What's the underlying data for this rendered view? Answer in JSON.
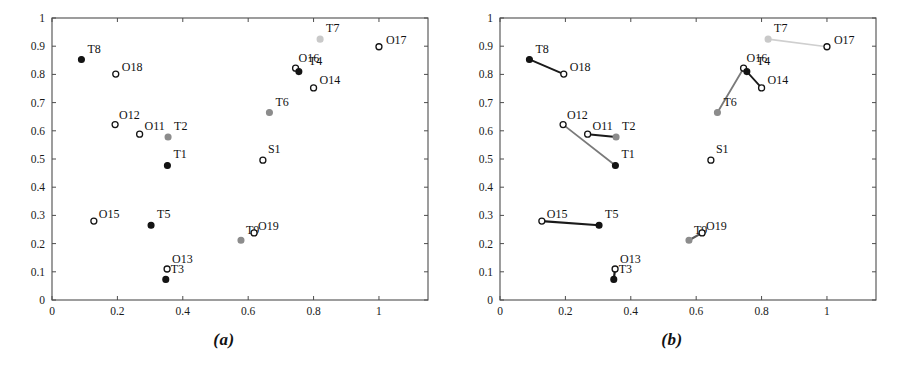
{
  "figure": {
    "width": 897,
    "height": 375,
    "background": "#ffffff"
  },
  "panels": [
    {
      "id": "a",
      "caption": "(a)",
      "shows_links": false
    },
    {
      "id": "b",
      "caption": "(b)",
      "shows_links": true
    }
  ],
  "colors": {
    "axis": "#4d4d4d",
    "text": "#111111",
    "marker_dark": "#141414",
    "marker_gray": "#8c8c8c",
    "marker_open": "#ffffff",
    "link_black": "#1a1a1a",
    "link_gray": "#7a7a7a",
    "link_light": "#cfcfcf"
  },
  "chart_data": {
    "type": "scatter",
    "title": "",
    "xlabel": "",
    "ylabel": "",
    "xlim": [
      0,
      1.15
    ],
    "ylim": [
      0,
      1.0
    ],
    "grid": false,
    "legend": "none",
    "xticks": [
      "0",
      "0.2",
      "0.4",
      "0.6",
      "0.8",
      "1"
    ],
    "xtick_values": [
      0,
      0.2,
      0.4,
      0.6,
      0.8,
      1
    ],
    "ytick_values": [
      0,
      0.1,
      0.2,
      0.3,
      0.4,
      0.5,
      0.6,
      0.7,
      0.8,
      0.9,
      1
    ],
    "yticks": [
      "0",
      "0.1",
      "0.2",
      "0.3",
      "0.4",
      "0.5",
      "0.6",
      "0.7",
      "0.8",
      "0.9",
      "1"
    ],
    "points": [
      {
        "label": "T8",
        "x": 0.09,
        "y": 0.853,
        "marker": "filled",
        "shade": "dark",
        "lx": 6,
        "ly": -6
      },
      {
        "label": "O18",
        "x": 0.195,
        "y": 0.801,
        "marker": "open",
        "shade": "dark",
        "lx": 6,
        "ly": -3
      },
      {
        "label": "T7",
        "x": 0.82,
        "y": 0.925,
        "marker": "filled",
        "shade": "light",
        "lx": 6,
        "ly": -7
      },
      {
        "label": "O17",
        "x": 1.0,
        "y": 0.898,
        "marker": "open",
        "shade": "dark",
        "lx": 7,
        "ly": -3
      },
      {
        "label": "O16",
        "x": 0.745,
        "y": 0.822,
        "marker": "open",
        "shade": "dark",
        "lx": 3,
        "ly": -6
      },
      {
        "label": "T4",
        "x": 0.755,
        "y": 0.81,
        "marker": "filled",
        "shade": "dark",
        "lx": 10,
        "ly": -7
      },
      {
        "label": "O14",
        "x": 0.8,
        "y": 0.752,
        "marker": "open",
        "shade": "dark",
        "lx": 6,
        "ly": -4
      },
      {
        "label": "T6",
        "x": 0.665,
        "y": 0.665,
        "marker": "filled",
        "shade": "gray",
        "lx": 6,
        "ly": -6
      },
      {
        "label": "O12",
        "x": 0.193,
        "y": 0.622,
        "marker": "open",
        "shade": "dark",
        "lx": 4,
        "ly": -6
      },
      {
        "label": "O11",
        "x": 0.268,
        "y": 0.588,
        "marker": "open",
        "shade": "dark",
        "lx": 5,
        "ly": -4
      },
      {
        "label": "T2",
        "x": 0.355,
        "y": 0.578,
        "marker": "filled",
        "shade": "gray",
        "lx": 6,
        "ly": -7
      },
      {
        "label": "T1",
        "x": 0.353,
        "y": 0.477,
        "marker": "filled",
        "shade": "dark",
        "lx": 6,
        "ly": -7
      },
      {
        "label": "S1",
        "x": 0.645,
        "y": 0.496,
        "marker": "open",
        "shade": "dark",
        "lx": 5,
        "ly": -7
      },
      {
        "label": "O15",
        "x": 0.128,
        "y": 0.28,
        "marker": "open",
        "shade": "dark",
        "lx": 5,
        "ly": -3
      },
      {
        "label": "T5",
        "x": 0.303,
        "y": 0.265,
        "marker": "filled",
        "shade": "dark",
        "lx": 6,
        "ly": -7
      },
      {
        "label": "T9",
        "x": 0.578,
        "y": 0.212,
        "marker": "filled",
        "shade": "gray",
        "lx": 5,
        "ly": -6
      },
      {
        "label": "O19",
        "x": 0.618,
        "y": 0.238,
        "marker": "open",
        "shade": "dark",
        "lx": 4,
        "ly": -3
      },
      {
        "label": "O13",
        "x": 0.352,
        "y": 0.11,
        "marker": "open",
        "shade": "dark",
        "lx": 5,
        "ly": -6
      },
      {
        "label": "T3",
        "x": 0.348,
        "y": 0.073,
        "marker": "filled",
        "shade": "dark",
        "lx": 5,
        "ly": -6
      }
    ],
    "links": [
      {
        "from": "T8",
        "to": "O18",
        "color": "#1a1a1a",
        "width": 2.0
      },
      {
        "from": "T7",
        "to": "O17",
        "color": "#cfcfcf",
        "width": 1.6
      },
      {
        "from": "T6",
        "to": "O16",
        "color": "#7a7a7a",
        "width": 1.8
      },
      {
        "from": "T4",
        "to": "O14",
        "color": "#1a1a1a",
        "width": 1.8
      },
      {
        "from": "O12",
        "to": "T1",
        "color": "#7a7a7a",
        "width": 1.8
      },
      {
        "from": "O11",
        "to": "T2",
        "color": "#1a1a1a",
        "width": 2.0
      },
      {
        "from": "O15",
        "to": "T5",
        "color": "#1a1a1a",
        "width": 2.2
      },
      {
        "from": "T9",
        "to": "O19",
        "color": "#5a5a5a",
        "width": 2.2
      },
      {
        "from": "T3",
        "to": "O13",
        "color": "#1a1a1a",
        "width": 2.2
      }
    ]
  }
}
